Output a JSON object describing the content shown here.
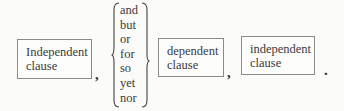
{
  "diagram": {
    "boxes": [
      {
        "line1": "Independent",
        "line2": "clause"
      },
      {
        "line1": "dependent",
        "line2": "clause"
      },
      {
        "line1": "independent",
        "line2": "clause"
      }
    ],
    "conjunctions": [
      "and",
      "but",
      "or",
      "for",
      "so",
      "yet",
      "nor"
    ],
    "punctuation": {
      "comma1": ",",
      "comma2": ",",
      "period": "."
    }
  }
}
